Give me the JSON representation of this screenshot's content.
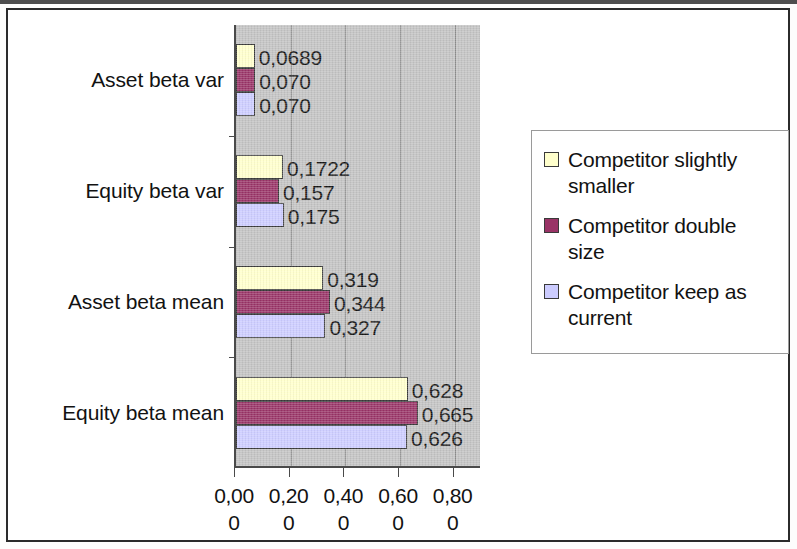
{
  "chart_data": {
    "type": "bar",
    "orientation": "horizontal",
    "title": "",
    "xlabel": "",
    "ylabel": "",
    "xlim": [
      0,
      0.9
    ],
    "grid": true,
    "grid_axis": "x",
    "legend_position": "right",
    "categories": [
      "Asset beta var",
      "Equity beta var",
      "Asset beta mean",
      "Equity beta mean"
    ],
    "xticks": [
      0.0,
      0.2,
      0.4,
      0.6,
      0.8
    ],
    "xtick_labels": [
      {
        "line1": "0,00",
        "line2": "0"
      },
      {
        "line1": "0,20",
        "line2": "0"
      },
      {
        "line1": "0,40",
        "line2": "0"
      },
      {
        "line1": "0,60",
        "line2": "0"
      },
      {
        "line1": "0,80",
        "line2": "0"
      }
    ],
    "series": [
      {
        "name": "Competitor slightly smaller",
        "color": "#FFFFCC",
        "values": [
          0.0689,
          0.1722,
          0.319,
          0.628
        ],
        "labels": [
          "0,0689",
          "0,1722",
          "0,319",
          "0,628"
        ]
      },
      {
        "name": "Competitor double size",
        "color": "#993366",
        "values": [
          0.07,
          0.157,
          0.344,
          0.665
        ],
        "labels": [
          "0,070",
          "0,157",
          "0,344",
          "0,665"
        ]
      },
      {
        "name": "Competitor keep as current",
        "color": "#CCCCFF",
        "values": [
          0.07,
          0.175,
          0.327,
          0.626
        ],
        "labels": [
          "0,070",
          "0,175",
          "0,327",
          "0,626"
        ]
      }
    ]
  },
  "legend": {
    "entries": [
      {
        "label": "Competitor slightly smaller",
        "color": "#FFFFCC"
      },
      {
        "label": "Competitor double size",
        "color": "#993366"
      },
      {
        "label": "Competitor keep as current",
        "color": "#CCCCFF"
      }
    ]
  }
}
